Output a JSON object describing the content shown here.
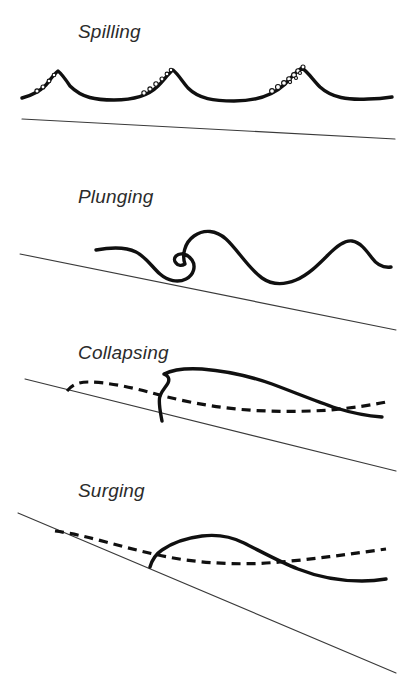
{
  "figure": {
    "background_color": "#ffffff",
    "ink_color": "#101010",
    "label_color": "#2b2b2b",
    "slope_color": "#3a3a3a",
    "width": 411,
    "height": 699
  },
  "panels": [
    {
      "id": "spilling",
      "label": "Spilling",
      "label_x": 78,
      "label_y": 38,
      "beach_slope_description": "very gentle slope",
      "has_dashed_profile": false,
      "has_foam_bubbles": true,
      "wave_count": 3
    },
    {
      "id": "plunging",
      "label": "Plunging",
      "label_x": 78,
      "label_y": 203,
      "beach_slope_description": "moderate slope",
      "has_dashed_profile": false,
      "has_foam_bubbles": false,
      "wave_count": 2
    },
    {
      "id": "collapsing",
      "label": "Collapsing",
      "label_x": 78,
      "label_y": 359,
      "beach_slope_description": "steep slope",
      "has_dashed_profile": true,
      "has_foam_bubbles": false,
      "wave_count": 1
    },
    {
      "id": "surging",
      "label": "Surging",
      "label_x": 78,
      "label_y": 497,
      "beach_slope_description": "very steep slope",
      "has_dashed_profile": true,
      "has_foam_bubbles": false,
      "wave_count": 1
    }
  ],
  "geometry": {
    "spilling": {
      "wave_profile": "M 22 98 C 30 96 38 93 46 85 C 50 80 54 74 58 71 C 62 74 66 80 70 86 C 82 98 96 100 114 100 C 134 100 148 96 158 86 C 164 80 168 74 173 70 C 178 74 182 81 188 88 C 199 99 214 101 234 101 C 256 101 272 96 284 85 C 291 78 296 71 302 68 C 308 72 313 80 320 87 C 332 98 348 100 368 99 C 378 99 386 98 392 97",
      "beach_slope": "M 22 119 L 395 139",
      "bubbles": [
        {
          "cx": 37,
          "cy": 91,
          "r": 2.1
        },
        {
          "cx": 43,
          "cy": 87,
          "r": 2.0
        },
        {
          "cx": 49,
          "cy": 81,
          "r": 1.9
        },
        {
          "cx": 54,
          "cy": 75,
          "r": 1.8
        },
        {
          "cx": 144,
          "cy": 93,
          "r": 2.2
        },
        {
          "cx": 150,
          "cy": 89,
          "r": 2.1
        },
        {
          "cx": 156,
          "cy": 84,
          "r": 2.2
        },
        {
          "cx": 162,
          "cy": 79,
          "r": 2.0
        },
        {
          "cx": 167,
          "cy": 74,
          "r": 1.9
        },
        {
          "cx": 171,
          "cy": 70,
          "r": 1.8
        },
        {
          "cx": 272,
          "cy": 91,
          "r": 2.4
        },
        {
          "cx": 278,
          "cy": 87,
          "r": 2.5
        },
        {
          "cx": 284,
          "cy": 83,
          "r": 2.4
        },
        {
          "cx": 289,
          "cy": 79,
          "r": 2.3
        },
        {
          "cx": 294,
          "cy": 75,
          "r": 2.4
        },
        {
          "cx": 298,
          "cy": 71,
          "r": 2.2
        },
        {
          "cx": 303,
          "cy": 67,
          "r": 2.0
        },
        {
          "cx": 290,
          "cy": 82,
          "r": 1.6
        },
        {
          "cx": 296,
          "cy": 78,
          "r": 1.5
        },
        {
          "cx": 300,
          "cy": 73,
          "r": 1.5
        }
      ]
    },
    "plunging": {
      "wave_profile": "M 96 250 C 112 247 126 247 136 252 C 146 257 152 267 160 274 C 168 281 178 283 186 279 C 194 275 196 266 192 260 C 188 254 180 252 176 256 C 174 258 174 261 176 263 C 178 266 182 266 185 264 C 182 256 184 243 194 236 C 204 229 216 230 226 239 C 238 250 248 268 262 278 C 272 285 284 285 296 280 C 308 275 318 265 328 255 C 336 247 344 240 352 241 C 360 242 366 250 372 258 C 377 265 383 268 391 267",
      "beach_slope": "M 20 254 L 396 330"
    },
    "collapsing": {
      "wave_profile": "M 162 421 C 160 410 158 402 160 396 C 162 390 166 387 168 383 C 170 379 168 375 164 374 C 172 370 186 368 202 369 C 228 371 252 377 272 384 C 296 393 318 402 336 408 C 352 413 368 416 382 417",
      "dashed_profile": "M 67 391 C 72 385 78 382 88 382 C 106 382 130 387 152 393 C 178 400 206 406 236 409 C 268 412 300 412 330 410 C 352 408 372 405 386 402",
      "beach_slope": "M 25 379 L 396 471"
    },
    "surging": {
      "wave_profile": "M 150 567 C 152 560 156 554 162 550 C 172 543 186 538 202 536 C 218 534 232 537 244 543 C 262 552 280 562 298 569 C 318 577 342 581 362 581 C 372 581 380 580 386 579",
      "dashed_profile": "M 55 531 C 70 533 88 537 106 542 C 132 549 158 556 186 560 C 216 564 248 565 280 562 C 316 559 350 554 386 549",
      "beach_slope": "M 18 513 L 396 673",
      "upper_slope_fragment": "M 288 470 L 396 514"
    }
  }
}
